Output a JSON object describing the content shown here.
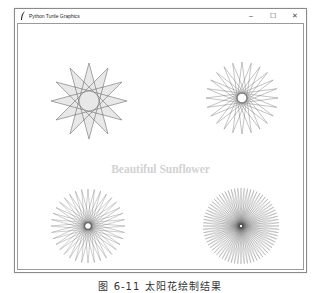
{
  "window": {
    "title": "Python Turtle Graphics",
    "icon": "feather-icon",
    "controls": {
      "minimize": "–",
      "maximize": "☐",
      "close": "✕"
    }
  },
  "canvas": {
    "label": "Beautiful Sunflower",
    "label_color": "#d2d2d2",
    "line_color": "#555555",
    "fill_color": "#e8e8e8",
    "figures": [
      {
        "name": "star-12",
        "cx": 71,
        "cy": 77,
        "r": 38,
        "points": 12,
        "step": 5,
        "filled": true,
        "stroke_width": 0.5
      },
      {
        "name": "sunflower-24",
        "cx": 224,
        "cy": 74,
        "r": 36,
        "points": 24,
        "step": 11,
        "filled": false,
        "stroke_width": 0.35
      },
      {
        "name": "sunflower-36",
        "cx": 70,
        "cy": 202,
        "r": 37,
        "points": 36,
        "step": 17,
        "filled": false,
        "stroke_width": 0.3
      },
      {
        "name": "sunflower-72",
        "cx": 223,
        "cy": 202,
        "r": 38,
        "points": 72,
        "step": 35,
        "filled": false,
        "stroke_width": 0.25
      }
    ]
  },
  "caption": "图 6-11   太阳花绘制结果"
}
